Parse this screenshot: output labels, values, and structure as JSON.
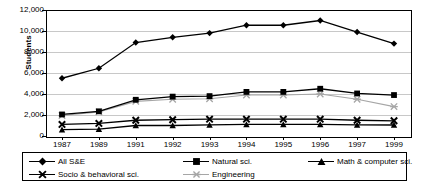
{
  "chart_data": {
    "type": "line",
    "title": "",
    "xlabel": "",
    "ylabel": "Students",
    "ylim": [
      0,
      12000
    ],
    "ytick_labels": [
      "12,000",
      "10,000",
      "8,000",
      "6,000",
      "4,000",
      "2,000",
      "0"
    ],
    "ytick_values": [
      12000,
      10000,
      8000,
      6000,
      4000,
      2000,
      0
    ],
    "grid": true,
    "legend_position": "bottom",
    "categories": [
      "1987",
      "1989",
      "1991",
      "1992",
      "1993",
      "1994",
      "1995",
      "1996",
      "1997",
      "1999"
    ],
    "series": [
      {
        "name": "All S&E",
        "marker": "diamond",
        "color": "#000000",
        "values": [
          5500,
          6450,
          8900,
          9400,
          9800,
          10550,
          10550,
          11000,
          9900,
          8800
        ]
      },
      {
        "name": "Natural sci.",
        "marker": "square",
        "color": "#000000",
        "values": [
          2050,
          2350,
          3450,
          3750,
          3800,
          4200,
          4200,
          4500,
          4050,
          3900
        ]
      },
      {
        "name": "Math & computer sci.",
        "marker": "triangle",
        "color": "#000000",
        "values": [
          600,
          650,
          1000,
          1000,
          1050,
          1100,
          1100,
          1100,
          1050,
          1050
        ]
      },
      {
        "name": "Socio & behavioral sci.",
        "marker": "cross",
        "color": "#000000",
        "values": [
          1100,
          1200,
          1500,
          1550,
          1600,
          1600,
          1600,
          1600,
          1500,
          1450
        ]
      },
      {
        "name": "Engineering",
        "marker": "asterisk",
        "color": "#a6a6a6",
        "values": [
          1950,
          2300,
          3300,
          3500,
          3550,
          3900,
          3900,
          4000,
          3500,
          2800
        ]
      }
    ]
  }
}
